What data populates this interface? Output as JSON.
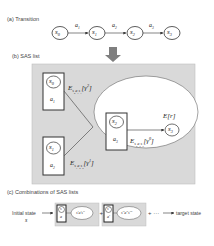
{
  "sections": {
    "a": {
      "title": "(a) Transition"
    },
    "b": {
      "title": "(b) SAS list"
    },
    "c": {
      "title": "(c) Combinations of SAS lists"
    }
  },
  "transition": {
    "states": [
      "S0",
      "S1",
      "S2",
      "S3"
    ],
    "actions": [
      "a1",
      "a2",
      "a3"
    ]
  },
  "sas_list": {
    "box_top": {
      "state": "S0",
      "action": "a1",
      "edge_label": "E_{s0a1s1}[γ²]"
    },
    "box_bottom": {
      "state": "S1",
      "action": "a2",
      "edge_label": "E_{s1a2s2}[γ¹]"
    },
    "inner": {
      "state": "S2",
      "action": "a3",
      "next_state": "S3",
      "reward_label": "E[r]",
      "edge_label": "E_{s2a3s3}[γ⁰]"
    }
  },
  "combinations": {
    "start_label": "Initial state",
    "start_symbol": "s",
    "items": [
      {
        "state": "s",
        "action": "a",
        "ellipse_text": "s'a's''"
      },
      {
        "state": "s'",
        "action": "a'",
        "ellipse_text": "s''a''s'''"
      }
    ],
    "plus": "+",
    "ellipsis": "+ ···",
    "end_label": "target state"
  },
  "colors": {
    "panel_fill": "#d9d9d9",
    "panel_border": "#bfbfbf",
    "arrow_gray": "#7f7f7f",
    "stroke": "#333333"
  }
}
